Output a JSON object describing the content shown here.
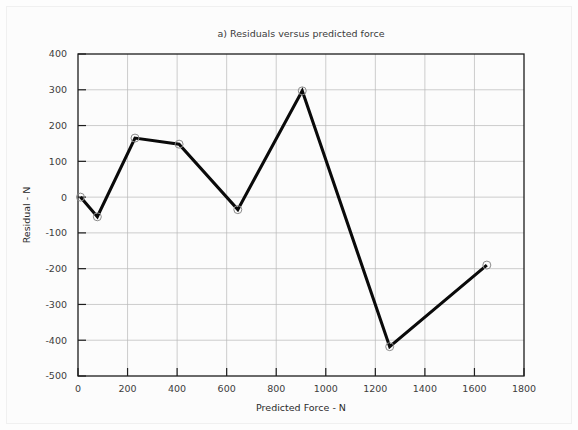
{
  "chart_data": {
    "type": "line",
    "title": "a) Residuals versus predicted force",
    "xlabel": "Predicted Force - N",
    "ylabel": "Residual - N",
    "xlim": [
      0,
      1800
    ],
    "ylim": [
      -500,
      400
    ],
    "xticks": [
      0,
      200,
      400,
      600,
      800,
      1000,
      1200,
      1400,
      1600,
      1800
    ],
    "yticks": [
      400,
      300,
      200,
      100,
      0,
      -100,
      -200,
      -300,
      -400,
      -500
    ],
    "xtick_labels": [
      "0",
      "200",
      "400",
      "600",
      "800",
      "1000",
      "1200",
      "1400",
      "1600",
      "1800"
    ],
    "ytick_labels": [
      "400",
      "300",
      "200",
      "100",
      "0",
      "-100",
      "-200",
      "-300",
      "-400",
      "-500"
    ],
    "grid": true,
    "legend": null,
    "series": [
      {
        "name": "Residuals",
        "marker": "open-circle",
        "line_color": "#0a0a0a",
        "marker_color": "#8a8a8a",
        "x": [
          10,
          78,
          230,
          408,
          645,
          905,
          1258,
          1650
        ],
        "y": [
          0,
          -55,
          165,
          148,
          -35,
          297,
          -418,
          -190
        ]
      }
    ]
  },
  "colors": {
    "background": "#fdfdfd",
    "grid": "#b8b8b8",
    "frame": "#1d1d1d",
    "line": "#0a0a0a",
    "marker_stroke": "#8a8a8a",
    "text": "#3d3d3d"
  }
}
